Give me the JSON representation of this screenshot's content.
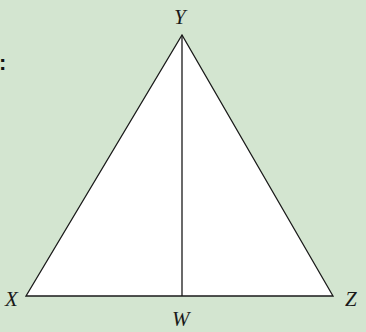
{
  "diagram": {
    "type": "triangle",
    "background_color": "#d3e5d0",
    "fill_color": "#ffffff",
    "stroke_color": "#1a1a1a",
    "prefix_text": ":",
    "vertices": {
      "X": {
        "label": "X",
        "x": 26,
        "y": 296
      },
      "Y": {
        "label": "Y",
        "x": 182,
        "y": 35
      },
      "Z": {
        "label": "Z",
        "x": 333,
        "y": 296
      }
    },
    "segments": [
      {
        "from": "X",
        "to": "Y"
      },
      {
        "from": "Y",
        "to": "Z"
      },
      {
        "from": "X",
        "to": "Z"
      },
      {
        "from": "Y",
        "to": "W"
      }
    ],
    "points": {
      "W": {
        "label": "W",
        "x": 182,
        "y": 296,
        "on_segment": "XZ"
      }
    }
  }
}
